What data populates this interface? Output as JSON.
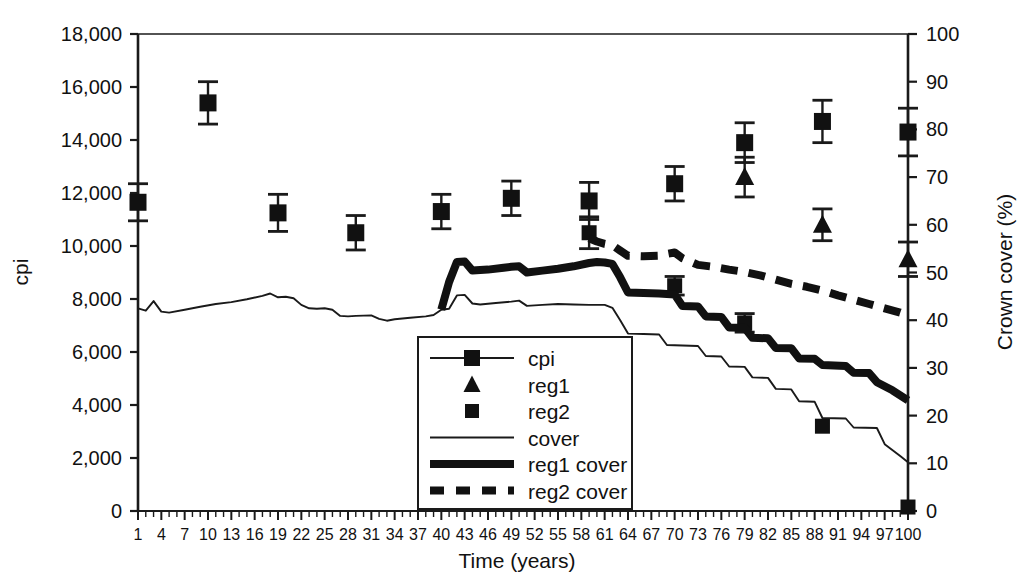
{
  "chart_data": {
    "type": "line",
    "title": "",
    "xlabel": "Time (years)",
    "ylabel": "cpi",
    "y2label": "Crown cover (%)",
    "xlim": [
      1,
      100
    ],
    "ylim": [
      0,
      18000
    ],
    "y2lim": [
      0,
      100
    ],
    "grid": false,
    "legend_position": "center-bottom-inside",
    "x_ticks": [
      1,
      4,
      7,
      10,
      13,
      16,
      19,
      22,
      25,
      28,
      31,
      34,
      37,
      40,
      43,
      46,
      49,
      52,
      55,
      58,
      61,
      64,
      67,
      70,
      73,
      76,
      79,
      82,
      85,
      88,
      91,
      94,
      97,
      100
    ],
    "x_tick_labels": [
      "1",
      "4",
      "7",
      "10",
      "13",
      "16",
      "19",
      "22",
      "25",
      "28",
      "31",
      "34",
      "37",
      "40",
      "43",
      "46",
      "49",
      "52",
      "55",
      "58",
      "61",
      "64",
      "67",
      "70",
      "73",
      "76",
      "79",
      "82",
      "85",
      "88",
      "91",
      "94",
      "97",
      "100"
    ],
    "y_ticks": [
      0,
      2000,
      4000,
      6000,
      8000,
      10000,
      12000,
      14000,
      16000,
      18000
    ],
    "y_tick_labels": [
      "0",
      "2,000",
      "4,000",
      "6,000",
      "8,000",
      "10,000",
      "12,000",
      "14,000",
      "16,000",
      "18,000"
    ],
    "y2_ticks": [
      0,
      10,
      20,
      30,
      40,
      50,
      60,
      70,
      80,
      90,
      100
    ],
    "y2_tick_labels": [
      "0",
      "10",
      "20",
      "30",
      "40",
      "50",
      "60",
      "70",
      "80",
      "90",
      "100"
    ],
    "legend": [
      {
        "name": "cpi",
        "marker": "square",
        "line": "thin-solid"
      },
      {
        "name": "reg1",
        "marker": "triangle",
        "line": "none"
      },
      {
        "name": "reg2",
        "marker": "square-small",
        "line": "none"
      },
      {
        "name": "cover",
        "marker": "none",
        "line": "thin-solid"
      },
      {
        "name": "reg1 cover",
        "marker": "none",
        "line": "thick-solid"
      },
      {
        "name": "reg2 cover",
        "marker": "none",
        "line": "thick-dashed"
      }
    ],
    "series": [
      {
        "name": "cpi",
        "axis": "left",
        "type": "scatter-errorbar",
        "marker": "square",
        "points": [
          {
            "x": 1,
            "y": 11650,
            "err_lo": 700,
            "err_hi": 700
          },
          {
            "x": 10,
            "y": 15400,
            "err_lo": 800,
            "err_hi": 800
          },
          {
            "x": 19,
            "y": 11250,
            "err_lo": 700,
            "err_hi": 700
          },
          {
            "x": 29,
            "y": 10500,
            "err_lo": 650,
            "err_hi": 650
          },
          {
            "x": 40,
            "y": 11300,
            "err_lo": 650,
            "err_hi": 650
          },
          {
            "x": 49,
            "y": 11800,
            "err_lo": 650,
            "err_hi": 650
          },
          {
            "x": 59,
            "y": 11700,
            "err_lo": 700,
            "err_hi": 700
          },
          {
            "x": 70,
            "y": 12350,
            "err_lo": 650,
            "err_hi": 650
          },
          {
            "x": 79,
            "y": 13900,
            "err_lo": 750,
            "err_hi": 750
          },
          {
            "x": 89,
            "y": 14700,
            "err_lo": 800,
            "err_hi": 800
          },
          {
            "x": 100,
            "y": 14300,
            "err_lo": 900,
            "err_hi": 900
          }
        ]
      },
      {
        "name": "reg1",
        "axis": "left",
        "type": "scatter-errorbar",
        "marker": "triangle",
        "points": [
          {
            "x": 79,
            "y": 12600,
            "err_lo": 750,
            "err_hi": 750
          },
          {
            "x": 89,
            "y": 10800,
            "err_lo": 600,
            "err_hi": 600
          },
          {
            "x": 100,
            "y": 9500,
            "err_lo": 650,
            "err_hi": 650
          }
        ]
      },
      {
        "name": "reg2",
        "axis": "left",
        "type": "scatter-errorbar",
        "marker": "square-small",
        "points": [
          {
            "x": 59,
            "y": 10500,
            "err_lo": 600,
            "err_hi": 600
          },
          {
            "x": 70,
            "y": 8500,
            "err_lo": 350,
            "err_hi": 350
          },
          {
            "x": 79,
            "y": 7100,
            "err_lo": 350,
            "err_hi": 350
          },
          {
            "x": 89,
            "y": 3200,
            "err_lo": 0,
            "err_hi": 0
          },
          {
            "x": 100,
            "y": 150,
            "err_lo": 0,
            "err_hi": 0
          }
        ]
      },
      {
        "name": "cover",
        "axis": "right",
        "type": "line",
        "values": [
          {
            "x": 1,
            "y": 42.5
          },
          {
            "x": 2,
            "y": 42.0
          },
          {
            "x": 3,
            "y": 44.0
          },
          {
            "x": 4,
            "y": 41.8
          },
          {
            "x": 5,
            "y": 41.6
          },
          {
            "x": 7,
            "y": 42.2
          },
          {
            "x": 9,
            "y": 42.8
          },
          {
            "x": 11,
            "y": 43.4
          },
          {
            "x": 13,
            "y": 43.8
          },
          {
            "x": 15,
            "y": 44.4
          },
          {
            "x": 17,
            "y": 45.1
          },
          {
            "x": 18,
            "y": 45.6
          },
          {
            "x": 19,
            "y": 44.8
          },
          {
            "x": 20,
            "y": 44.9
          },
          {
            "x": 21,
            "y": 44.6
          },
          {
            "x": 22,
            "y": 43.2
          },
          {
            "x": 23,
            "y": 42.5
          },
          {
            "x": 24,
            "y": 42.4
          },
          {
            "x": 25,
            "y": 42.5
          },
          {
            "x": 26,
            "y": 42.2
          },
          {
            "x": 27,
            "y": 40.9
          },
          {
            "x": 28,
            "y": 40.8
          },
          {
            "x": 29,
            "y": 40.9
          },
          {
            "x": 31,
            "y": 41.0
          },
          {
            "x": 32,
            "y": 40.3
          },
          {
            "x": 33,
            "y": 39.9
          },
          {
            "x": 34,
            "y": 40.2
          },
          {
            "x": 36,
            "y": 40.5
          },
          {
            "x": 38,
            "y": 40.8
          },
          {
            "x": 39,
            "y": 41.1
          },
          {
            "x": 40,
            "y": 42.2
          },
          {
            "x": 41,
            "y": 42.4
          },
          {
            "x": 42,
            "y": 45.2
          },
          {
            "x": 43,
            "y": 45.3
          },
          {
            "x": 44,
            "y": 43.5
          },
          {
            "x": 45,
            "y": 43.3
          },
          {
            "x": 47,
            "y": 43.6
          },
          {
            "x": 49,
            "y": 43.9
          },
          {
            "x": 50,
            "y": 44.1
          },
          {
            "x": 51,
            "y": 43.0
          },
          {
            "x": 53,
            "y": 43.2
          },
          {
            "x": 55,
            "y": 43.4
          },
          {
            "x": 57,
            "y": 43.3
          },
          {
            "x": 59,
            "y": 43.2
          },
          {
            "x": 61,
            "y": 43.2
          },
          {
            "x": 62,
            "y": 42.6
          },
          {
            "x": 63,
            "y": 40.0
          },
          {
            "x": 64,
            "y": 37.2
          },
          {
            "x": 66,
            "y": 37.1
          },
          {
            "x": 68,
            "y": 37.0
          },
          {
            "x": 69,
            "y": 34.8
          },
          {
            "x": 71,
            "y": 34.7
          },
          {
            "x": 73,
            "y": 34.6
          },
          {
            "x": 74,
            "y": 32.5
          },
          {
            "x": 76,
            "y": 32.4
          },
          {
            "x": 77,
            "y": 30.3
          },
          {
            "x": 79,
            "y": 30.2
          },
          {
            "x": 80,
            "y": 28.0
          },
          {
            "x": 82,
            "y": 27.9
          },
          {
            "x": 83,
            "y": 25.6
          },
          {
            "x": 85,
            "y": 25.5
          },
          {
            "x": 86,
            "y": 23.0
          },
          {
            "x": 88,
            "y": 22.9
          },
          {
            "x": 89,
            "y": 19.5
          },
          {
            "x": 92,
            "y": 19.4
          },
          {
            "x": 93,
            "y": 17.5
          },
          {
            "x": 96,
            "y": 17.4
          },
          {
            "x": 97,
            "y": 14.0
          },
          {
            "x": 99,
            "y": 11.5
          },
          {
            "x": 100,
            "y": 10.2
          }
        ]
      },
      {
        "name": "reg1 cover",
        "axis": "right",
        "type": "line-thick",
        "values": [
          {
            "x": 40,
            "y": 42.2
          },
          {
            "x": 41,
            "y": 48.0
          },
          {
            "x": 42,
            "y": 52.2
          },
          {
            "x": 43,
            "y": 52.3
          },
          {
            "x": 44,
            "y": 50.4
          },
          {
            "x": 46,
            "y": 50.6
          },
          {
            "x": 48,
            "y": 51.0
          },
          {
            "x": 49,
            "y": 51.2
          },
          {
            "x": 50,
            "y": 51.3
          },
          {
            "x": 51,
            "y": 50.0
          },
          {
            "x": 53,
            "y": 50.4
          },
          {
            "x": 55,
            "y": 50.8
          },
          {
            "x": 57,
            "y": 51.3
          },
          {
            "x": 59,
            "y": 52.0
          },
          {
            "x": 60,
            "y": 52.2
          },
          {
            "x": 61,
            "y": 52.1
          },
          {
            "x": 62,
            "y": 51.8
          },
          {
            "x": 63,
            "y": 49.0
          },
          {
            "x": 64,
            "y": 45.8
          },
          {
            "x": 66,
            "y": 45.7
          },
          {
            "x": 68,
            "y": 45.6
          },
          {
            "x": 69,
            "y": 45.5
          },
          {
            "x": 70,
            "y": 45.4
          },
          {
            "x": 71,
            "y": 43.0
          },
          {
            "x": 73,
            "y": 42.9
          },
          {
            "x": 74,
            "y": 40.8
          },
          {
            "x": 76,
            "y": 40.7
          },
          {
            "x": 77,
            "y": 38.5
          },
          {
            "x": 79,
            "y": 38.4
          },
          {
            "x": 80,
            "y": 36.3
          },
          {
            "x": 82,
            "y": 36.2
          },
          {
            "x": 83,
            "y": 34.2
          },
          {
            "x": 85,
            "y": 34.1
          },
          {
            "x": 86,
            "y": 32.0
          },
          {
            "x": 88,
            "y": 31.9
          },
          {
            "x": 89,
            "y": 30.6
          },
          {
            "x": 92,
            "y": 30.4
          },
          {
            "x": 93,
            "y": 29.0
          },
          {
            "x": 95,
            "y": 28.9
          },
          {
            "x": 96,
            "y": 27.0
          },
          {
            "x": 98,
            "y": 25.3
          },
          {
            "x": 100,
            "y": 23.2
          }
        ]
      },
      {
        "name": "reg2 cover",
        "axis": "right",
        "type": "line-thick-dashed",
        "values": [
          {
            "x": 59,
            "y": 57.2
          },
          {
            "x": 60,
            "y": 56.5
          },
          {
            "x": 61,
            "y": 56.0
          },
          {
            "x": 62,
            "y": 55.7
          },
          {
            "x": 63,
            "y": 54.6
          },
          {
            "x": 64,
            "y": 53.5
          },
          {
            "x": 66,
            "y": 53.4
          },
          {
            "x": 68,
            "y": 53.5
          },
          {
            "x": 69,
            "y": 53.9
          },
          {
            "x": 70,
            "y": 54.2
          },
          {
            "x": 71,
            "y": 53.0
          },
          {
            "x": 73,
            "y": 51.6
          },
          {
            "x": 75,
            "y": 51.2
          },
          {
            "x": 77,
            "y": 50.6
          },
          {
            "x": 79,
            "y": 50.1
          },
          {
            "x": 81,
            "y": 49.4
          },
          {
            "x": 83,
            "y": 48.5
          },
          {
            "x": 85,
            "y": 47.6
          },
          {
            "x": 87,
            "y": 47.0
          },
          {
            "x": 89,
            "y": 46.2
          },
          {
            "x": 91,
            "y": 45.2
          },
          {
            "x": 93,
            "y": 44.3
          },
          {
            "x": 95,
            "y": 43.4
          },
          {
            "x": 97,
            "y": 42.5
          },
          {
            "x": 99,
            "y": 41.6
          },
          {
            "x": 100,
            "y": 41.0
          }
        ]
      }
    ]
  }
}
